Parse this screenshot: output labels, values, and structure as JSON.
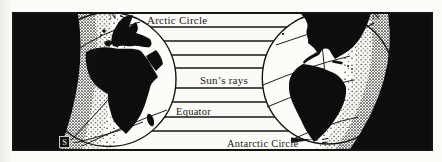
{
  "diagram": {
    "type": "earth-sun-rays-textbook-figure",
    "labels": {
      "arctic_circle": "Arctic Circle",
      "suns_rays": "Sun’s rays",
      "equator": "Equator",
      "antarctic_circle": "Antarctic Circle",
      "north_pole_left": "N",
      "north_pole_right": "N",
      "south_pole_left": "S",
      "south_pole_right": "S"
    },
    "sun_rays_count": 8,
    "colors": {
      "ink": "#1a1a1a",
      "shadow_black": "#0d0d0d",
      "paper": "#fbfaf6"
    }
  }
}
